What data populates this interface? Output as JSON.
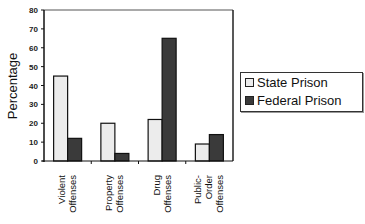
{
  "chart_data": {
    "type": "bar",
    "title": "",
    "xlabel": "",
    "ylabel": "Percentage",
    "ylim": [
      0,
      80
    ],
    "yticks": [
      0,
      10,
      20,
      30,
      40,
      50,
      60,
      70,
      80
    ],
    "categories": [
      [
        "Violent",
        "Offenses"
      ],
      [
        "Property",
        "Offenses"
      ],
      [
        "Drug",
        "Offenses"
      ],
      [
        "Public-",
        "Order",
        "Offenses"
      ]
    ],
    "series": [
      {
        "name": "State Prison",
        "color": "#ececec",
        "values": [
          45,
          20,
          22,
          9
        ]
      },
      {
        "name": "Federal Prison",
        "color": "#3a3a3a",
        "values": [
          12,
          4,
          65,
          14
        ]
      }
    ],
    "grid": false,
    "legend_position": "right"
  }
}
